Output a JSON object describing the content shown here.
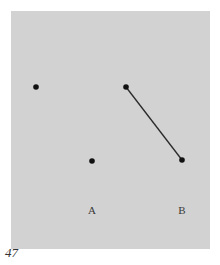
{
  "figure": {
    "number": "47",
    "panel_color": "#d2d2d2",
    "ink_color": "#111111",
    "groups": [
      {
        "label": "A",
        "connected": false
      },
      {
        "label": "B",
        "connected": true
      }
    ],
    "points": [
      {
        "id": "A1",
        "group": "A"
      },
      {
        "id": "A2",
        "group": "A"
      },
      {
        "id": "B1",
        "group": "B"
      },
      {
        "id": "B2",
        "group": "B"
      }
    ],
    "segments": [
      {
        "from": "B1",
        "to": "B2"
      }
    ]
  }
}
